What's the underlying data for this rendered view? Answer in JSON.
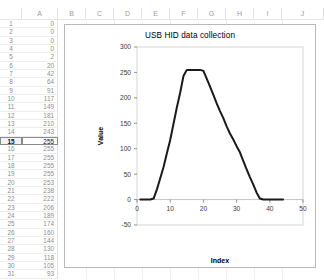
{
  "spreadsheet": {
    "column_headers": [
      "A",
      "B",
      "C",
      "D",
      "E",
      "F",
      "G",
      "H",
      "I",
      "J"
    ],
    "selected_row": 15,
    "selected_cell": "A15",
    "column_a_header": "A",
    "rows": [
      {
        "n": "1",
        "a": "0"
      },
      {
        "n": "2",
        "a": "0"
      },
      {
        "n": "3",
        "a": "0"
      },
      {
        "n": "4",
        "a": "0"
      },
      {
        "n": "5",
        "a": "2"
      },
      {
        "n": "6",
        "a": "20"
      },
      {
        "n": "7",
        "a": "42"
      },
      {
        "n": "8",
        "a": "64"
      },
      {
        "n": "9",
        "a": "91"
      },
      {
        "n": "10",
        "a": "117"
      },
      {
        "n": "11",
        "a": "149"
      },
      {
        "n": "12",
        "a": "181"
      },
      {
        "n": "13",
        "a": "210"
      },
      {
        "n": "14",
        "a": "243"
      },
      {
        "n": "15",
        "a": "255"
      },
      {
        "n": "16",
        "a": "255"
      },
      {
        "n": "17",
        "a": "255"
      },
      {
        "n": "18",
        "a": "255"
      },
      {
        "n": "19",
        "a": "255"
      },
      {
        "n": "20",
        "a": "253"
      },
      {
        "n": "21",
        "a": "238"
      },
      {
        "n": "22",
        "a": "222"
      },
      {
        "n": "23",
        "a": "206"
      },
      {
        "n": "24",
        "a": "189"
      },
      {
        "n": "25",
        "a": "174"
      },
      {
        "n": "26",
        "a": "160"
      },
      {
        "n": "27",
        "a": "144"
      },
      {
        "n": "28",
        "a": "130"
      },
      {
        "n": "29",
        "a": "118"
      },
      {
        "n": "30",
        "a": "105"
      },
      {
        "n": "31",
        "a": "93"
      }
    ]
  },
  "chart_data": {
    "type": "line",
    "title": "USB HID data collection",
    "xlabel": "Index",
    "ylabel": "Value",
    "xlim": [
      0,
      50
    ],
    "ylim": [
      -50,
      300
    ],
    "xticks": [
      0,
      10,
      20,
      30,
      40,
      50
    ],
    "yticks": [
      -50,
      0,
      50,
      100,
      150,
      200,
      250,
      300
    ],
    "grid": false,
    "legend": "none",
    "line_color": "#1a1a1a",
    "x": [
      1,
      2,
      3,
      4,
      5,
      6,
      7,
      8,
      9,
      10,
      11,
      12,
      13,
      14,
      15,
      16,
      17,
      18,
      19,
      20,
      21,
      22,
      23,
      24,
      25,
      26,
      27,
      28,
      29,
      30,
      31,
      32,
      33,
      34,
      35,
      36,
      37,
      38,
      39,
      40,
      41,
      42,
      43,
      44
    ],
    "values": [
      0,
      0,
      0,
      0,
      2,
      20,
      42,
      64,
      91,
      117,
      149,
      181,
      210,
      243,
      255,
      255,
      255,
      255,
      255,
      253,
      238,
      222,
      206,
      189,
      174,
      160,
      144,
      130,
      118,
      105,
      93,
      76,
      60,
      44,
      30,
      14,
      2,
      0,
      0,
      0,
      0,
      0,
      0,
      0
    ],
    "series": [
      {
        "name": "Value",
        "values": [
          0,
          0,
          0,
          0,
          2,
          20,
          42,
          64,
          91,
          117,
          149,
          181,
          210,
          243,
          255,
          255,
          255,
          255,
          255,
          253,
          238,
          222,
          206,
          189,
          174,
          160,
          144,
          130,
          118,
          105,
          93,
          76,
          60,
          44,
          30,
          14,
          2,
          0,
          0,
          0,
          0,
          0,
          0,
          0
        ]
      }
    ]
  }
}
